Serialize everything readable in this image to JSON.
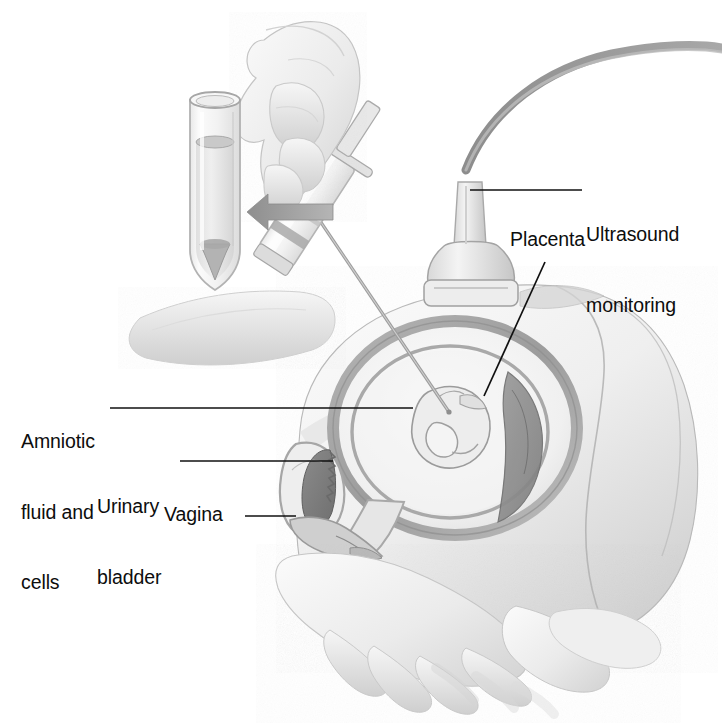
{
  "figure": {
    "style": "pencil-shaded medical illustration",
    "background_color": "#ffffff",
    "ink_color": "#0d0d0d",
    "pencil_gray": "#9a9a9a"
  },
  "labels": {
    "ultrasound": "Ultrasound\nmonitoring",
    "ultrasound_line1": "Ultrasound",
    "ultrasound_line2": "monitoring",
    "placenta": "Placenta",
    "amniotic": "Amniotic\nfluid and\ncells",
    "amniotic_line1": "Amniotic",
    "amniotic_line2": "fluid and",
    "amniotic_line3": "cells",
    "bladder": "Urinary\nbladder",
    "bladder_line1": "Urinary",
    "bladder_line2": "bladder",
    "vagina": "Vagina"
  },
  "parts": [
    {
      "name": "test-tube",
      "description": "Conical-bottom centrifuge tube holding aspirated amniotic fluid with sediment of cells"
    },
    {
      "name": "collection-arrow",
      "description": "Gray arrow pointing left from syringe toward test tube"
    },
    {
      "name": "clinician-hand",
      "description": "Hand gripping the syringe plunger"
    },
    {
      "name": "syringe",
      "description": "Syringe barrel with plunger, angled down-right"
    },
    {
      "name": "needle",
      "description": "Long thin needle passing through abdominal wall into amniotic cavity"
    },
    {
      "name": "ultrasound-transducer",
      "description": "Ultrasound probe resting on the abdomen with cable curving up to the right"
    },
    {
      "name": "maternal-abdomen",
      "description": "Gravid maternal abdomen shown in sagittal section"
    },
    {
      "name": "uterus",
      "description": "Uterine wall ring enclosing the amniotic cavity"
    },
    {
      "name": "fetus",
      "description": "Fetus curled within the amniotic cavity"
    },
    {
      "name": "placenta",
      "description": "Placenta on the posterior-right uterine wall"
    },
    {
      "name": "urinary-bladder",
      "description": "Urinary bladder with rugose lining, anterior to the uterus"
    },
    {
      "name": "vagina",
      "description": "Vaginal canal inferior to the bladder and cervix"
    },
    {
      "name": "supporting-hands",
      "description": "Hands supporting the lower abdomen"
    }
  ],
  "leader_lines": [
    {
      "name": "ultrasound-leader",
      "from": [
        586,
        190
      ],
      "to": [
        470,
        190
      ],
      "style": "horizontal"
    },
    {
      "name": "placenta-leader",
      "from": [
        545,
        262
      ],
      "to": [
        484,
        396
      ],
      "style": "diagonal"
    },
    {
      "name": "amniotic-leader",
      "from": [
        110,
        408
      ],
      "to": [
        413,
        408
      ],
      "style": "horizontal"
    },
    {
      "name": "bladder-leader",
      "from": [
        180,
        461
      ],
      "to": [
        333,
        461
      ],
      "style": "horizontal"
    },
    {
      "name": "vagina-leader",
      "from": [
        245,
        516
      ],
      "to": [
        296,
        516
      ],
      "style": "horizontal"
    }
  ]
}
